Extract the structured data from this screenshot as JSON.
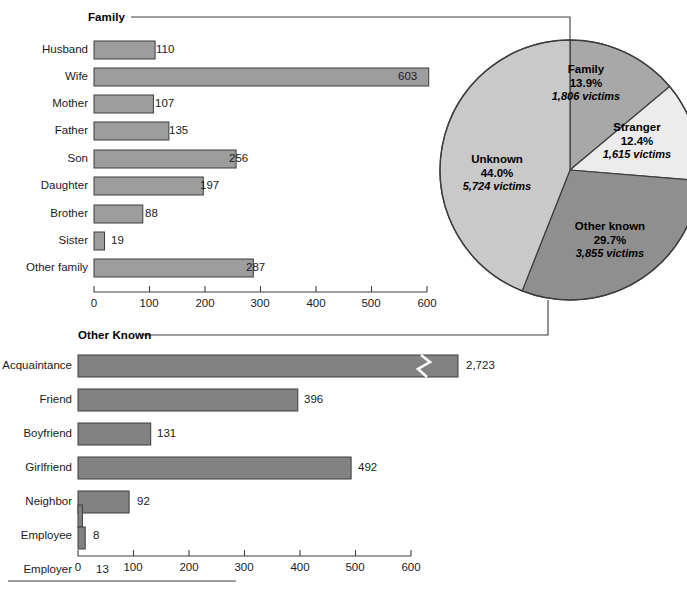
{
  "chart_data": [
    {
      "type": "bar",
      "orientation": "horizontal",
      "title": "Family",
      "categories": [
        "Husband",
        "Wife",
        "Mother",
        "Father",
        "Son",
        "Daughter",
        "Brother",
        "Sister",
        "Other family"
      ],
      "values": [
        110,
        603,
        107,
        135,
        256,
        197,
        88,
        19,
        287
      ],
      "value_labels": [
        "110",
        "603",
        "107",
        "135",
        "256",
        "197",
        "88",
        "19",
        "287"
      ],
      "xlabel": "",
      "ylabel": "",
      "xlim": [
        0,
        600
      ],
      "xticks": [
        0,
        100,
        200,
        300,
        400,
        500,
        600
      ],
      "xtick_labels": [
        "0",
        "100",
        "200",
        "300",
        "400",
        "500",
        "600"
      ],
      "grid": false,
      "bar_color": "#9d9d9d"
    },
    {
      "type": "pie",
      "title": "",
      "labels": [
        "Family",
        "Stranger",
        "Other known",
        "Unknown"
      ],
      "percent_labels": [
        "13.9%",
        "12.4%",
        "29.7%",
        "44.0%"
      ],
      "values": [
        13.9,
        12.4,
        29.7,
        44.0
      ],
      "victim_counts": [
        1806,
        1615,
        3855,
        5724
      ],
      "victim_labels": [
        "1,806 victims",
        "1,615 victims",
        "3,855 victims",
        "5,724 victims"
      ],
      "slice_colors": [
        "#a8a8a8",
        "#ececec",
        "#8f8f8f",
        "#c9c9c9"
      ],
      "legend": "none"
    },
    {
      "type": "bar",
      "orientation": "horizontal",
      "title": "Other Known",
      "categories": [
        "Acquaintance",
        "Friend",
        "Boyfriend",
        "Girlfriend",
        "Neighbor",
        "Employee",
        "Employer"
      ],
      "values": [
        2723,
        396,
        131,
        492,
        92,
        8,
        13
      ],
      "value_labels": [
        "2,723",
        "396",
        "131",
        "492",
        "92",
        "8",
        "13"
      ],
      "axis_break": {
        "category": "Acquaintance",
        "note": "bar truncated with break mark"
      },
      "xlabel": "",
      "ylabel": "",
      "xlim": [
        0,
        600
      ],
      "xticks": [
        0,
        100,
        200,
        300,
        400,
        500,
        600
      ],
      "xtick_labels": [
        "0",
        "100",
        "200",
        "300",
        "400",
        "500",
        "600"
      ],
      "grid": false,
      "bar_color": "#828282"
    }
  ],
  "figure": {
    "family_panel_title": "Family",
    "other_known_panel_title": "Other Known"
  },
  "colors": {
    "bar_top": "#9d9d9d",
    "bar_bottom": "#828282",
    "outline": "#3c3c3c",
    "pie_family": "#a8a8a8",
    "pie_stranger": "#ececec",
    "pie_other_known": "#8f8f8f",
    "pie_unknown": "#c9c9c9"
  }
}
